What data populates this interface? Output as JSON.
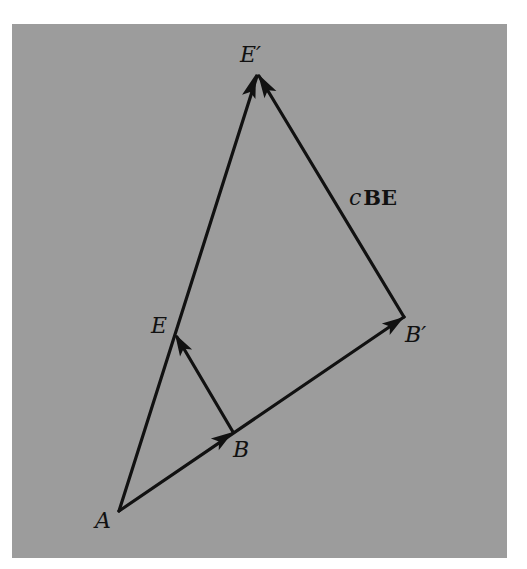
{
  "figure": {
    "background_color": "#9c9c9c",
    "line_color": "#111111",
    "points": {
      "A": {
        "label": "A",
        "x": 119,
        "y": 511
      },
      "B": {
        "label": "B",
        "x": 233,
        "y": 432
      },
      "Bp": {
        "label": "B′",
        "x": 404,
        "y": 317
      },
      "E": {
        "label": "E",
        "x": 175,
        "y": 334
      },
      "Ep": {
        "label": "E′",
        "x": 257,
        "y": 73
      }
    },
    "vectors": [
      {
        "from": "A",
        "to": "Bp",
        "arrowhead_at": "B",
        "note": "A to B′ through B"
      },
      {
        "from": "B",
        "to": "Bp",
        "arrowhead_at": "Bp"
      },
      {
        "from": "A",
        "to": "Ep",
        "arrowhead_at": "Ep",
        "note": "A to E′ through E"
      },
      {
        "from": "B",
        "to": "E",
        "arrowhead_at": "E"
      },
      {
        "from": "Bp",
        "to": "Ep",
        "arrowhead_at": "Ep",
        "label": "cBE"
      }
    ],
    "vector_label": {
      "scalar": "c",
      "vector": "BE"
    }
  }
}
